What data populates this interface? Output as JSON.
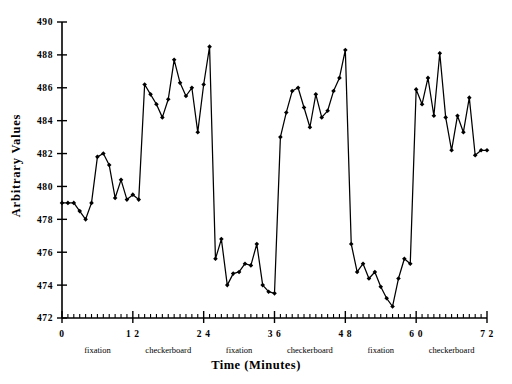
{
  "chart_data": {
    "type": "line",
    "title": "",
    "xlabel": "Time  (Minutes)",
    "ylabel": "Arbitrary  Values",
    "xlim": [
      0,
      72
    ],
    "ylim": [
      472,
      490
    ],
    "grid": false,
    "legend": "none",
    "y_ticks": [
      472,
      474,
      476,
      478,
      480,
      482,
      484,
      486,
      488,
      490
    ],
    "y_tick_labels": [
      "472",
      "474",
      "476",
      "478",
      "480",
      "482",
      "484",
      "486",
      "488",
      "490"
    ],
    "x_ticks": [
      0,
      12,
      24,
      36,
      48,
      60,
      72
    ],
    "x_tick_labels": [
      "0",
      "1 2",
      "2 4",
      "3 6",
      "4 8",
      "6 0",
      "7 2"
    ],
    "x_minor_tick_interval": 1,
    "marker": "filled-diamond",
    "line_color": "#000000",
    "condition_blocks": [
      {
        "label": "fixation",
        "start": 0,
        "end": 12
      },
      {
        "label": "checkerboard",
        "start": 12,
        "end": 24
      },
      {
        "label": "fixation",
        "start": 24,
        "end": 36
      },
      {
        "label": "checkerboard",
        "start": 36,
        "end": 48
      },
      {
        "label": "fixation",
        "start": 48,
        "end": 60
      },
      {
        "label": "checkerboard",
        "start": 60,
        "end": 72
      }
    ],
    "x": [
      0,
      1,
      2,
      3,
      4,
      5,
      6,
      7,
      8,
      9,
      10,
      11,
      12,
      13,
      14,
      15,
      16,
      17,
      18,
      19,
      20,
      21,
      22,
      23,
      24,
      25,
      26,
      27,
      28,
      29,
      30,
      31,
      32,
      33,
      34,
      35,
      36,
      37,
      38,
      39,
      40,
      41,
      42,
      43,
      44,
      45,
      46,
      47,
      48,
      49,
      50,
      51,
      52,
      53,
      54,
      55,
      56,
      57,
      58,
      59,
      60,
      61,
      62,
      63,
      64,
      65,
      66,
      67,
      68,
      69,
      70,
      71,
      72
    ],
    "values": [
      479.0,
      479.0,
      479.0,
      478.5,
      478.0,
      479.0,
      481.8,
      482.0,
      481.3,
      479.3,
      480.4,
      479.2,
      479.5,
      479.2,
      486.2,
      485.6,
      485.0,
      484.2,
      485.3,
      487.7,
      486.3,
      485.5,
      486.0,
      483.3,
      486.2,
      488.5,
      475.6,
      476.8,
      474.0,
      474.7,
      474.8,
      475.3,
      475.2,
      476.5,
      474.0,
      473.6,
      473.5,
      483.0,
      484.5,
      485.8,
      486.0,
      484.8,
      483.6,
      485.6,
      484.2,
      484.6,
      485.8,
      486.6,
      488.3,
      476.5,
      474.8,
      475.3,
      474.4,
      474.8,
      473.9,
      473.2,
      472.7,
      474.4,
      475.6,
      475.3,
      485.9,
      485.0,
      486.6,
      484.3,
      488.1,
      484.2,
      482.2,
      484.3,
      483.3,
      485.4,
      481.9,
      482.2,
      482.2
    ]
  }
}
